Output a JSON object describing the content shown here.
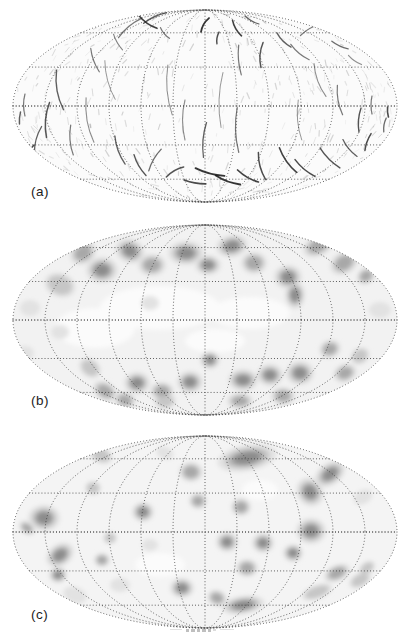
{
  "figure": {
    "grid": {
      "meridian_divisions": 6,
      "parallel_fractions": [
        0,
        0.4054,
        0.7625
      ],
      "dot_color": "#3c3c3c",
      "dot_width": 1.0
    },
    "palette": {
      "contour_levels": [
        "#e2e2e2",
        "#c6c6c6",
        "#a8a8a8",
        "#8c8c8c"
      ],
      "white_patch": "#fbfbfb",
      "filament": "#1e1e1e",
      "speckle": "#6f6f6f"
    },
    "panels": [
      {
        "id": "a",
        "label": "(a)",
        "type": "filament",
        "bg": "#fbfbfb",
        "ellipse": {
          "cx": 205,
          "cy": 106,
          "rx": 192,
          "ry": 96
        },
        "speckle": {
          "seed": 1234567,
          "count": 430
        },
        "streaks": [
          [
            148,
            22,
            35,
            22,
            3,
            1.6,
            0.85
          ],
          [
            165,
            33,
            50,
            14,
            2,
            1.2,
            0.6
          ],
          [
            205,
            25,
            120,
            16,
            3,
            1.8,
            0.9
          ],
          [
            218,
            38,
            100,
            12,
            2,
            1.4,
            0.8
          ],
          [
            237,
            28,
            60,
            18,
            3,
            1.6,
            0.85
          ],
          [
            252,
            20,
            30,
            16,
            2,
            1.2,
            0.7
          ],
          [
            262,
            55,
            95,
            25,
            4,
            1.5,
            0.75
          ],
          [
            240,
            60,
            85,
            30,
            3,
            1.2,
            0.6
          ],
          [
            284,
            40,
            45,
            20,
            3,
            1.3,
            0.7
          ],
          [
            300,
            52,
            40,
            24,
            3,
            1.2,
            0.6
          ],
          [
            118,
            42,
            60,
            18,
            2,
            1.1,
            0.55
          ],
          [
            95,
            60,
            70,
            25,
            3,
            1.2,
            0.6
          ],
          [
            340,
            45,
            25,
            18,
            2,
            1.3,
            0.65
          ],
          [
            355,
            60,
            35,
            16,
            2,
            1.1,
            0.5
          ],
          [
            60,
            90,
            80,
            40,
            6,
            1.4,
            0.7
          ],
          [
            48,
            120,
            95,
            35,
            5,
            1.5,
            0.75
          ],
          [
            38,
            140,
            105,
            28,
            4,
            1.3,
            0.7
          ],
          [
            72,
            140,
            85,
            30,
            4,
            1.2,
            0.6
          ],
          [
            90,
            120,
            80,
            45,
            6,
            1.1,
            0.5
          ],
          [
            25,
            105,
            90,
            22,
            3,
            1.2,
            0.6
          ],
          [
            110,
            80,
            75,
            40,
            5,
            1.0,
            0.45
          ],
          [
            120,
            150,
            70,
            30,
            4,
            1.3,
            0.7
          ],
          [
            140,
            165,
            60,
            24,
            3,
            1.4,
            0.75
          ],
          [
            170,
            90,
            85,
            50,
            6,
            1.0,
            0.5
          ],
          [
            185,
            120,
            90,
            40,
            5,
            1.1,
            0.5
          ],
          [
            205,
            140,
            95,
            35,
            4,
            1.3,
            0.7
          ],
          [
            222,
            100,
            92,
            55,
            6,
            1.0,
            0.45
          ],
          [
            238,
            130,
            88,
            45,
            5,
            1.2,
            0.6
          ],
          [
            210,
            172,
            15,
            30,
            3,
            1.8,
            0.9
          ],
          [
            228,
            180,
            20,
            26,
            3,
            1.9,
            0.9
          ],
          [
            248,
            176,
            30,
            24,
            3,
            1.7,
            0.85
          ],
          [
            195,
            182,
            10,
            22,
            2,
            1.6,
            0.8
          ],
          [
            262,
            166,
            75,
            28,
            4,
            1.5,
            0.8
          ],
          [
            288,
            160,
            55,
            30,
            4,
            1.6,
            0.85
          ],
          [
            305,
            168,
            40,
            26,
            3,
            1.5,
            0.8
          ],
          [
            330,
            158,
            45,
            28,
            3,
            1.4,
            0.75
          ],
          [
            350,
            148,
            50,
            22,
            3,
            1.3,
            0.7
          ],
          [
            175,
            172,
            150,
            20,
            3,
            1.5,
            0.75
          ],
          [
            155,
            160,
            120,
            25,
            3,
            1.3,
            0.65
          ],
          [
            320,
            80,
            70,
            35,
            5,
            1.1,
            0.5
          ],
          [
            340,
            100,
            80,
            30,
            4,
            1.2,
            0.6
          ],
          [
            360,
            120,
            95,
            24,
            3,
            1.4,
            0.75
          ],
          [
            372,
            105,
            90,
            18,
            2,
            1.2,
            0.6
          ],
          [
            385,
            125,
            100,
            14,
            2,
            1.3,
            0.65
          ],
          [
            300,
            120,
            85,
            40,
            5,
            1.0,
            0.45
          ],
          [
            368,
            142,
            110,
            18,
            2,
            1.5,
            0.8
          ],
          [
            388,
            112,
            85,
            10,
            1,
            1.6,
            0.8
          ],
          [
            30,
            152,
            120,
            16,
            2,
            1.5,
            0.8
          ],
          [
            20,
            118,
            95,
            12,
            1,
            1.4,
            0.7
          ],
          [
            130,
            28,
            140,
            30,
            4,
            1.2,
            0.6
          ],
          [
            155,
            18,
            155,
            25,
            3,
            1.4,
            0.7
          ],
          [
            310,
            30,
            150,
            22,
            3,
            1.2,
            0.6
          ],
          [
            330,
            22,
            160,
            18,
            2,
            1.0,
            0.5
          ]
        ]
      },
      {
        "id": "b",
        "label": "(b)",
        "type": "contour",
        "bg": "#f2f2f2",
        "ellipse": {
          "cx": 205,
          "cy": 107,
          "rx": 192,
          "ry": 95
        },
        "white_patches": [
          [
            160,
            95,
            60,
            22,
            0
          ],
          [
            250,
            100,
            40,
            16,
            0
          ],
          [
            215,
            128,
            30,
            12,
            0
          ],
          [
            95,
            115,
            40,
            20,
            0
          ]
        ],
        "blobs": [
          [
            60,
            72,
            16,
            12,
            20,
            2
          ],
          [
            83,
            40,
            14,
            11,
            -30,
            3
          ],
          [
            102,
            57,
            16,
            13,
            0,
            4
          ],
          [
            130,
            38,
            15,
            12,
            20,
            4
          ],
          [
            152,
            52,
            14,
            11,
            0,
            3
          ],
          [
            186,
            40,
            18,
            12,
            0,
            4
          ],
          [
            208,
            52,
            13,
            10,
            0,
            4
          ],
          [
            232,
            33,
            16,
            11,
            -10,
            4
          ],
          [
            254,
            50,
            13,
            11,
            0,
            3
          ],
          [
            288,
            64,
            14,
            12,
            0,
            4
          ],
          [
            295,
            82,
            10,
            14,
            0,
            4
          ],
          [
            318,
            33,
            16,
            10,
            -25,
            3
          ],
          [
            344,
            50,
            15,
            11,
            -30,
            3
          ],
          [
            366,
            63,
            10,
            8,
            -35,
            3
          ],
          [
            370,
            40,
            12,
            8,
            -40,
            2
          ],
          [
            30,
            95,
            10,
            8,
            0,
            1
          ],
          [
            60,
            119,
            9,
            7,
            0,
            1
          ],
          [
            25,
            140,
            9,
            7,
            0,
            1
          ],
          [
            150,
            90,
            9,
            7,
            0,
            1
          ],
          [
            380,
            97,
            11,
            8,
            0,
            1
          ],
          [
            137,
            170,
            13,
            11,
            0,
            4
          ],
          [
            162,
            178,
            12,
            9,
            0,
            3
          ],
          [
            190,
            169,
            13,
            11,
            0,
            4
          ],
          [
            210,
            147,
            10,
            9,
            0,
            4
          ],
          [
            243,
            167,
            15,
            11,
            0,
            4
          ],
          [
            270,
            162,
            13,
            11,
            0,
            4
          ],
          [
            300,
            160,
            14,
            12,
            0,
            4
          ],
          [
            330,
            136,
            11,
            9,
            -20,
            3
          ],
          [
            345,
            160,
            12,
            9,
            -20,
            3
          ],
          [
            360,
            143,
            10,
            8,
            -30,
            2
          ],
          [
            90,
            155,
            12,
            9,
            40,
            2
          ],
          [
            105,
            178,
            13,
            9,
            30,
            3
          ],
          [
            125,
            187,
            11,
            8,
            15,
            3
          ],
          [
            165,
            188,
            11,
            8,
            0,
            2
          ],
          [
            240,
            188,
            13,
            8,
            0,
            3
          ],
          [
            283,
            183,
            12,
            9,
            0,
            3
          ]
        ]
      },
      {
        "id": "c",
        "label": "(c)",
        "type": "contour",
        "bg": "#f4f4f4",
        "ellipse": {
          "cx": 205,
          "cy": 107,
          "rx": 192,
          "ry": 96
        },
        "white_patches": [
          [
            260,
            65,
            18,
            10,
            0
          ],
          [
            160,
            140,
            25,
            12,
            0
          ]
        ],
        "blobs": [
          [
            247,
            33,
            30,
            13,
            -10,
            4
          ],
          [
            330,
            49,
            17,
            11,
            -35,
            4
          ],
          [
            310,
            67,
            13,
            15,
            -35,
            4
          ],
          [
            191,
            47,
            12,
            10,
            0,
            3
          ],
          [
            198,
            76,
            9,
            8,
            0,
            3
          ],
          [
            241,
            82,
            10,
            9,
            0,
            3
          ],
          [
            311,
            106,
            15,
            13,
            0,
            4
          ],
          [
            101,
            30,
            12,
            8,
            25,
            2
          ],
          [
            165,
            28,
            9,
            6,
            20,
            1
          ],
          [
            44,
            93,
            16,
            13,
            0,
            4
          ],
          [
            27,
            103,
            9,
            6,
            35,
            3
          ],
          [
            60,
            130,
            15,
            11,
            -35,
            4
          ],
          [
            58,
            150,
            9,
            8,
            0,
            4
          ],
          [
            102,
            135,
            8,
            7,
            0,
            3
          ],
          [
            143,
            87,
            11,
            10,
            0,
            4
          ],
          [
            110,
            113,
            7,
            6,
            0,
            2
          ],
          [
            93,
            63,
            8,
            7,
            0,
            2
          ],
          [
            227,
            117,
            11,
            10,
            0,
            4
          ],
          [
            263,
            118,
            11,
            10,
            0,
            4
          ],
          [
            293,
            128,
            10,
            9,
            0,
            4
          ],
          [
            247,
            143,
            11,
            9,
            0,
            3
          ],
          [
            182,
            163,
            12,
            10,
            0,
            4
          ],
          [
            243,
            180,
            22,
            9,
            -8,
            4
          ],
          [
            217,
            173,
            10,
            8,
            20,
            3
          ],
          [
            337,
            148,
            14,
            8,
            -25,
            3
          ],
          [
            317,
            167,
            16,
            7,
            -20,
            2
          ],
          [
            360,
            155,
            12,
            7,
            -30,
            2
          ],
          [
            367,
            143,
            9,
            6,
            -35,
            2
          ],
          [
            75,
            170,
            12,
            8,
            20,
            1
          ],
          [
            120,
            160,
            10,
            7,
            0,
            1
          ],
          [
            150,
            120,
            8,
            6,
            0,
            1
          ],
          [
            363,
            72,
            10,
            7,
            -30,
            1
          ]
        ]
      }
    ],
    "caption_clipped": true
  }
}
